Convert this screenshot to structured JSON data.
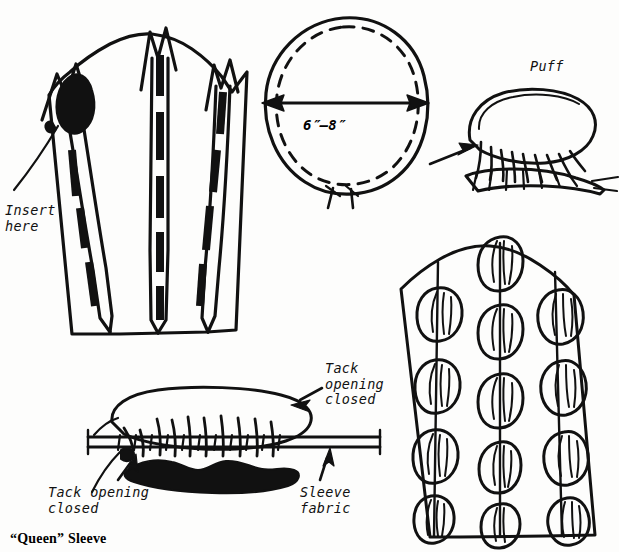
{
  "figure": {
    "caption": "“Queen” Sleeve",
    "background_color": "#fdfdfc",
    "ink_color": "#111111"
  },
  "labels": {
    "insert_here": "Insert\nhere",
    "puff": "Puff",
    "tack_opening_closed_top": "Tack\nopening\nclosed",
    "tack_opening_closed_bottom": "Tack opening\nclosed",
    "sleeve_fabric": "Sleeve\nfabric"
  },
  "dimension": {
    "value": "6″–8″",
    "arrow": "double-headed-horizontal"
  },
  "panels": {
    "sleeve_pattern_left": {
      "name": "sleeve pattern with insert slits",
      "channel_count": 3,
      "insert_marker": "black teardrop at upper left slit"
    },
    "circle_pattern": {
      "name": "puff circle pattern piece",
      "stitch_line": "dashed running stitch inside edge",
      "diameter_label": "6″–8″",
      "thread_tails": 2
    },
    "puff_finished": {
      "name": "gathered puff",
      "pointer": "arrow from left"
    },
    "assembly_bottom": {
      "name": "puff tacked to sleeve fabric strip",
      "pointer_top_right": "arrow to tack opening closed",
      "pointer_bottom_left": "arrow to tack opening closed",
      "pointer_bottom_right": "arrow to sleeve fabric"
    },
    "sleeve_finished_right": {
      "name": "finished sleeve with puffs",
      "columns": 3,
      "puffs_per_column": [
        4,
        4,
        4
      ]
    }
  }
}
